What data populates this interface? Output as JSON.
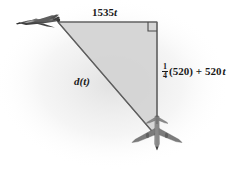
{
  "figure": {
    "type": "geometry-diagram",
    "background_color": "#ffffff",
    "fill_color": "#d4d4d4",
    "line_color": "#555555",
    "text_color": "#1a1a1a",
    "labels": {
      "horizontal_leg": "1535t",
      "horizontal_leg_coefficient": "1535",
      "horizontal_leg_variable": "t",
      "vertical_leg_fraction_numerator": "1",
      "vertical_leg_fraction_denominator": "4",
      "vertical_leg_paren": "(520)",
      "vertical_leg_plus": "+",
      "vertical_leg_term": "520",
      "vertical_leg_variable": "t",
      "hypotenuse_function": "d",
      "hypotenuse_paren_open": "(",
      "hypotenuse_variable": "t",
      "hypotenuse_paren_close": ")"
    },
    "icons": {
      "jet": "fighter-jet-icon",
      "airliner": "airliner-icon",
      "right_angle": "right-angle-marker-icon"
    },
    "vertices": {
      "top_left": "jet position",
      "top_right": "right angle vertex",
      "bottom": "airliner position"
    }
  }
}
